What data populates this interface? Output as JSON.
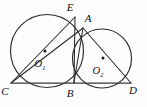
{
  "figure": {
    "background_color": "#fdfdfd",
    "stroke_color": "#2b2b2b",
    "label_color": "#111111",
    "width": 147,
    "height": 107
  },
  "labels": {
    "point_E": "E",
    "point_A": "A",
    "point_C": "C",
    "point_B": "B",
    "point_D": "D",
    "center_1": "O",
    "center_1_sub": "1",
    "center_2": "O",
    "center_2_sub": "2"
  },
  "chart_data": {
    "type": "diagram",
    "circles": [
      {
        "name": "circle-1",
        "center_label": "O1",
        "cx": 47,
        "cy": 51,
        "r": 36.5
      },
      {
        "name": "circle-2",
        "center_label": "O2",
        "cx": 102,
        "cy": 58.5,
        "r": 29.5
      }
    ],
    "points": [
      {
        "label": "E",
        "x": 75,
        "y": 17,
        "label_x": 70,
        "label_y": 11
      },
      {
        "label": "A",
        "x": 83,
        "y": 28,
        "label_x": 88,
        "label_y": 22
      },
      {
        "label": "C",
        "x": 11,
        "y": 83,
        "label_x": 5,
        "label_y": 95
      },
      {
        "label": "B",
        "x": 74,
        "y": 83,
        "label_x": 70,
        "label_y": 97
      },
      {
        "label": "D",
        "x": 131,
        "y": 83,
        "label_x": 133,
        "label_y": 94
      }
    ],
    "center_markers": [
      {
        "for": "O1",
        "x": 45,
        "y": 51
      },
      {
        "for": "O2",
        "x": 103,
        "y": 58
      }
    ],
    "center_labels": [
      {
        "label": "O",
        "sub": "1",
        "x": 40,
        "y": 66
      },
      {
        "label": "O",
        "sub": "2",
        "x": 97,
        "y": 73
      }
    ],
    "segments": [
      {
        "name": "C-E",
        "from": "C",
        "to": "E",
        "x1": 11,
        "y1": 83,
        "x2": 75,
        "y2": 17
      },
      {
        "name": "C-A",
        "from": "C",
        "to": "A",
        "x1": 11,
        "y1": 83,
        "x2": 83,
        "y2": 28
      },
      {
        "name": "E-B",
        "from": "E",
        "to": "B",
        "x1": 75,
        "y1": 17,
        "x2": 74,
        "y2": 83
      },
      {
        "name": "A-B",
        "from": "A",
        "to": "B",
        "x1": 83,
        "y1": 28,
        "x2": 74,
        "y2": 83
      },
      {
        "name": "A-D",
        "from": "A",
        "to": "D",
        "x1": 83,
        "y1": 28,
        "x2": 131,
        "y2": 83
      },
      {
        "name": "C-D",
        "from": "C",
        "to": "D",
        "x1": 11,
        "y1": 83,
        "x2": 131,
        "y2": 83
      }
    ]
  }
}
